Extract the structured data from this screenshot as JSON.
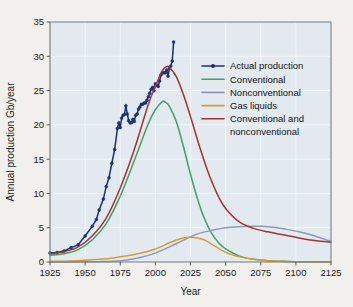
{
  "chart_data": {
    "type": "line",
    "title": "",
    "xlabel": "Year",
    "ylabel": "Annual production Gb/year",
    "xlim": [
      1925,
      2125
    ],
    "ylim": [
      0,
      35
    ],
    "xticks": [
      1925,
      1950,
      1975,
      2000,
      2025,
      2050,
      2075,
      2100,
      2125
    ],
    "yticks": [
      0,
      5,
      10,
      15,
      20,
      25,
      30,
      35
    ],
    "grid": true,
    "legend_position": "upper-right-inside",
    "colors": {
      "actual_production": "#1b2f7a",
      "conventional": "#3fa06a",
      "nonconventional": "#8c9ab5",
      "gas_liquids": "#d99a3c",
      "conventional_and_nonconventional": "#a83232",
      "plot_background": "#e2eaf0",
      "page_background": "#f2f0ec",
      "grid": "#ffffff",
      "axis": "#6f7b80"
    },
    "series": [
      {
        "name": "Actual production",
        "color": "#1b2f7a",
        "style": "line-with-markers",
        "x": [
          1925,
          1930,
          1935,
          1940,
          1945,
          1950,
          1955,
          1958,
          1960,
          1963,
          1965,
          1967,
          1969,
          1971,
          1973,
          1974,
          1975,
          1976,
          1977,
          1978,
          1979,
          1980,
          1981,
          1982,
          1983,
          1984,
          1985,
          1986,
          1987,
          1988,
          1989,
          1990,
          1991,
          1992,
          1993,
          1994,
          1995,
          1996,
          1997,
          1998,
          1999,
          2000,
          2001,
          2002,
          2003,
          2004,
          2005,
          2006,
          2007,
          2008,
          2009,
          2010,
          2011,
          2012,
          2013
        ],
        "y": [
          1.3,
          1.4,
          1.6,
          2.1,
          2.5,
          3.8,
          5.2,
          6.2,
          7.6,
          9.2,
          11.0,
          12.3,
          14.4,
          16.4,
          19.5,
          20.3,
          19.6,
          21.0,
          21.4,
          21.5,
          22.8,
          21.6,
          20.6,
          20.3,
          20.3,
          20.8,
          20.5,
          21.4,
          21.6,
          22.3,
          22.6,
          23.0,
          23.0,
          23.2,
          23.2,
          23.6,
          24.1,
          24.6,
          25.2,
          25.5,
          25.0,
          26.0,
          25.8,
          25.6,
          26.4,
          27.3,
          27.6,
          27.6,
          27.6,
          28.0,
          27.1,
          28.3,
          28.6,
          29.3,
          32.1
        ]
      },
      {
        "name": "Conventional",
        "color": "#3fa06a",
        "style": "smooth-curve",
        "x": [
          1925,
          1935,
          1945,
          1955,
          1965,
          1975,
          1985,
          1995,
          2000,
          2005,
          2007,
          2010,
          2015,
          2020,
          2025,
          2030,
          2035,
          2040,
          2045,
          2050,
          2060,
          2070,
          2080,
          2090,
          2100,
          2110,
          2125
        ],
        "y": [
          1.0,
          1.2,
          1.8,
          3.2,
          5.6,
          9.6,
          14.8,
          20.2,
          22.2,
          23.4,
          23.3,
          22.7,
          20.4,
          16.8,
          12.8,
          9.2,
          6.3,
          4.2,
          2.8,
          1.9,
          0.85,
          0.4,
          0.2,
          0.1,
          0.05,
          0.02,
          0.0
        ]
      },
      {
        "name": "Nonconventional",
        "color": "#8c9ab5",
        "style": "smooth-curve",
        "x": [
          1925,
          1950,
          1960,
          1970,
          1980,
          1990,
          2000,
          2010,
          2020,
          2030,
          2040,
          2050,
          2060,
          2070,
          2075,
          2080,
          2090,
          2100,
          2110,
          2125
        ],
        "y": [
          0.0,
          0.02,
          0.05,
          0.12,
          0.3,
          0.7,
          1.3,
          2.2,
          3.2,
          4.1,
          4.6,
          5.0,
          5.15,
          5.2,
          5.2,
          5.15,
          4.9,
          4.5,
          4.0,
          3.0
        ]
      },
      {
        "name": "Gas liquids",
        "color": "#d99a3c",
        "style": "smooth-curve",
        "x": [
          1925,
          1940,
          1950,
          1960,
          1970,
          1980,
          1990,
          2000,
          2010,
          2015,
          2020,
          2025,
          2030,
          2035,
          2040,
          2050,
          2060,
          2070,
          2080,
          2090,
          2100,
          2110,
          2125
        ],
        "y": [
          0.1,
          0.15,
          0.25,
          0.4,
          0.6,
          0.9,
          1.3,
          1.9,
          2.8,
          3.2,
          3.5,
          3.6,
          3.5,
          3.2,
          2.6,
          1.4,
          0.75,
          0.4,
          0.2,
          0.1,
          0.05,
          0.02,
          0.0
        ]
      },
      {
        "name": "Conventional and nonconventional",
        "color": "#a83232",
        "style": "smooth-curve",
        "x": [
          1925,
          1935,
          1945,
          1955,
          1965,
          1975,
          1985,
          1995,
          2000,
          2005,
          2008,
          2010,
          2015,
          2020,
          2025,
          2030,
          2035,
          2040,
          2045,
          2050,
          2060,
          2070,
          2080,
          2090,
          2100,
          2110,
          2125
        ],
        "y": [
          1.2,
          1.5,
          2.2,
          3.8,
          6.4,
          10.8,
          16.4,
          23.0,
          25.6,
          27.9,
          28.5,
          28.4,
          27.0,
          24.4,
          21.2,
          17.8,
          14.6,
          11.8,
          9.5,
          7.8,
          5.8,
          4.9,
          4.4,
          4.0,
          3.6,
          3.2,
          2.9
        ]
      }
    ],
    "legend": [
      {
        "label": "Actual production",
        "color": "#1b2f7a",
        "marker": true
      },
      {
        "label": "Conventional",
        "color": "#3fa06a",
        "marker": false
      },
      {
        "label": "Nonconventional",
        "color": "#8c9ab5",
        "marker": false
      },
      {
        "label": "Gas liquids",
        "color": "#d99a3c",
        "marker": false
      },
      {
        "label": "Conventional and",
        "color": "#a83232",
        "marker": false
      },
      {
        "label": "nonconventional",
        "color": "#a83232",
        "marker": false,
        "continuation": true
      }
    ]
  }
}
